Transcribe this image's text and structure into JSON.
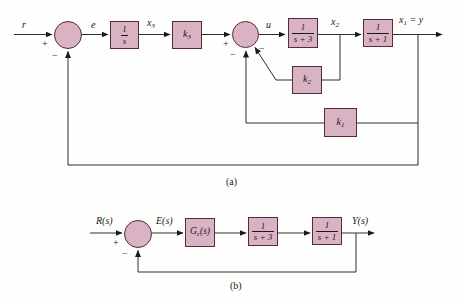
{
  "colors": {
    "block_fill": "#d9b2c3",
    "block_border": "#57293b",
    "wire": "#2e2e2e",
    "text": "#1a1a1a"
  },
  "diagram_a": {
    "caption": "(a)",
    "labels": {
      "input": "r",
      "error": "e",
      "x3": {
        "base": "x",
        "sub": "3"
      },
      "control": "u",
      "x2": {
        "base": "x",
        "sub": "2"
      },
      "output": {
        "base": "x",
        "sub": "1",
        "rest": " = y"
      }
    },
    "blocks": {
      "integrator": {
        "num": "1",
        "den": "s"
      },
      "k3": {
        "base": "k",
        "sub": "3"
      },
      "tf_s3": {
        "num": "1",
        "den": "s + 3"
      },
      "tf_s1": {
        "num": "1",
        "den": "s + 1"
      },
      "k2": {
        "base": "k",
        "sub": "2"
      },
      "k1": {
        "base": "k",
        "sub": "1"
      }
    },
    "signs": {
      "sum1_plus": "+",
      "sum1_minus": "−",
      "sum2_plus": "+",
      "sum2_minus_lower": "−",
      "sum2_minus_inner": "−"
    }
  },
  "diagram_b": {
    "caption": "(b)",
    "labels": {
      "input": "R(s)",
      "error": "E(s)",
      "output": "Y(s)"
    },
    "blocks": {
      "controller": {
        "base": "G",
        "sub": "c",
        "rest": "(s)"
      },
      "tf_s3": {
        "num": "1",
        "den": "s + 3"
      },
      "tf_s1": {
        "num": "1",
        "den": "s + 1"
      }
    },
    "signs": {
      "plus": "+",
      "minus": "−"
    }
  }
}
